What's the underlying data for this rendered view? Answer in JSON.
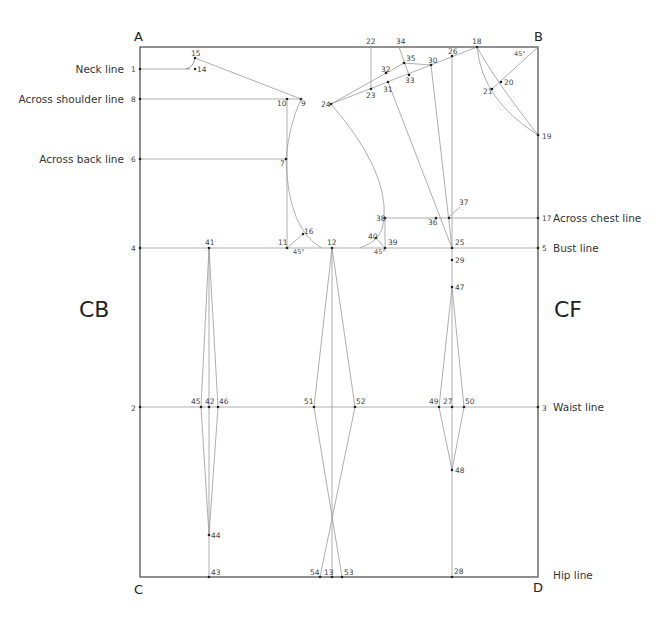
{
  "corners": {
    "A": "A",
    "B": "B",
    "C": "C",
    "D": "D"
  },
  "sides": {
    "left": "CB",
    "right": "CF"
  },
  "guide_lines": {
    "neck": "Neck line",
    "across_shoulder": "Across shoulder line",
    "across_back": "Across back line",
    "across_chest": "Across chest line",
    "bust": "Bust line",
    "waist": "Waist line",
    "hip": "Hip line"
  },
  "angles": {
    "a1": "45°",
    "a2": "45°",
    "a3": "45°"
  },
  "points": {
    "p1": "1",
    "p2": "2",
    "p3": "3",
    "p4": "4",
    "p5": "5",
    "p6": "6",
    "p7": "7",
    "p8": "8",
    "p9": "9",
    "p10": "10",
    "p11": "11",
    "p12": "12",
    "p13": "13",
    "p14": "14",
    "p15": "15",
    "p16": "16",
    "p17": "17",
    "p18": "18",
    "p19": "19",
    "p20": "20",
    "p21": "21",
    "p22": "22",
    "p23": "23",
    "p24": "24",
    "p25": "25",
    "p26": "26",
    "p27": "27",
    "p28": "28",
    "p29": "29",
    "p30": "30",
    "p31": "31",
    "p32": "32",
    "p33": "33",
    "p34": "34",
    "p35": "35",
    "p36": "36",
    "p37": "37",
    "p38": "38",
    "p39": "39",
    "p40": "40",
    "p41": "41",
    "p42": "42",
    "p43": "43",
    "p44": "44",
    "p45": "45",
    "p46": "46",
    "p47": "47",
    "p48": "48",
    "p49": "49",
    "p50": "50",
    "p51": "51",
    "p52": "52",
    "p53": "53",
    "p54": "54"
  }
}
